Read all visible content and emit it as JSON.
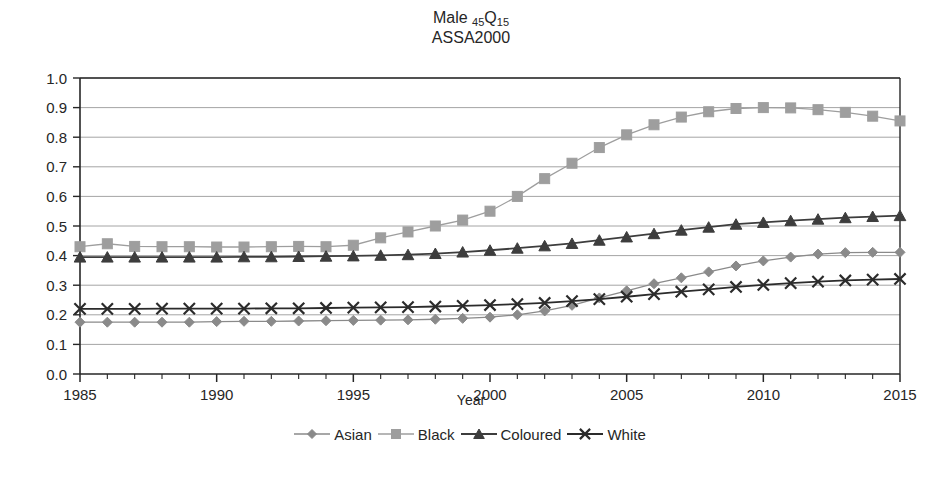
{
  "chart_data": {
    "type": "line",
    "title": "Male 45Q15",
    "title_main": "Male ",
    "title_sub1": "45",
    "title_q": "Q",
    "title_sub2": "15",
    "subtitle": "ASSA2000",
    "xlabel": "Year",
    "ylabel": "",
    "xlim": [
      1985,
      2015
    ],
    "ylim": [
      0.0,
      1.0
    ],
    "grid": "horizontal",
    "legend_position": "bottom",
    "x": [
      1985,
      1986,
      1987,
      1988,
      1989,
      1990,
      1991,
      1992,
      1993,
      1994,
      1995,
      1996,
      1997,
      1998,
      1999,
      2000,
      2001,
      2002,
      2003,
      2004,
      2005,
      2006,
      2007,
      2008,
      2009,
      2010,
      2011,
      2012,
      2013,
      2014,
      2015
    ],
    "xticks": [
      1985,
      1990,
      1995,
      2000,
      2005,
      2010,
      2015
    ],
    "xticklabels": [
      "1985",
      "1990",
      "1995",
      "2000",
      "2005",
      "2010",
      "2015"
    ],
    "yticks": [
      0.0,
      0.1,
      0.2,
      0.3,
      0.4,
      0.5,
      0.6,
      0.7,
      0.8,
      0.9,
      1.0
    ],
    "yticklabels": [
      "0.0",
      "0.1",
      "0.2",
      "0.3",
      "0.4",
      "0.5",
      "0.6",
      "0.7",
      "0.8",
      "0.9",
      "1.0"
    ],
    "series": [
      {
        "name": "Asian",
        "marker": "diamond",
        "color": "#8a8a8a",
        "values": [
          0.175,
          0.175,
          0.175,
          0.175,
          0.175,
          0.177,
          0.178,
          0.178,
          0.179,
          0.18,
          0.181,
          0.182,
          0.183,
          0.185,
          0.188,
          0.192,
          0.2,
          0.213,
          0.232,
          0.257,
          0.281,
          0.305,
          0.325,
          0.345,
          0.365,
          0.382,
          0.395,
          0.405,
          0.41,
          0.411,
          0.411
        ]
      },
      {
        "name": "Black",
        "marker": "square",
        "color": "#9e9e9e",
        "values": [
          0.43,
          0.44,
          0.431,
          0.43,
          0.43,
          0.429,
          0.429,
          0.43,
          0.431,
          0.43,
          0.435,
          0.46,
          0.48,
          0.5,
          0.52,
          0.55,
          0.6,
          0.66,
          0.712,
          0.765,
          0.808,
          0.842,
          0.868,
          0.886,
          0.897,
          0.9,
          0.899,
          0.893,
          0.884,
          0.871,
          0.855
        ]
      },
      {
        "name": "Coloured",
        "marker": "triangle",
        "color": "#3d3d3d",
        "values": [
          0.395,
          0.395,
          0.395,
          0.395,
          0.395,
          0.395,
          0.396,
          0.396,
          0.397,
          0.398,
          0.399,
          0.401,
          0.403,
          0.407,
          0.412,
          0.418,
          0.425,
          0.433,
          0.441,
          0.452,
          0.463,
          0.474,
          0.486,
          0.496,
          0.506,
          0.512,
          0.518,
          0.523,
          0.528,
          0.532,
          0.535
        ]
      },
      {
        "name": "White",
        "marker": "x",
        "color": "#2b2b2b",
        "values": [
          0.22,
          0.22,
          0.22,
          0.221,
          0.221,
          0.221,
          0.221,
          0.222,
          0.222,
          0.223,
          0.224,
          0.225,
          0.226,
          0.228,
          0.23,
          0.233,
          0.236,
          0.24,
          0.246,
          0.253,
          0.261,
          0.27,
          0.278,
          0.286,
          0.294,
          0.301,
          0.307,
          0.312,
          0.316,
          0.319,
          0.321
        ]
      }
    ]
  }
}
